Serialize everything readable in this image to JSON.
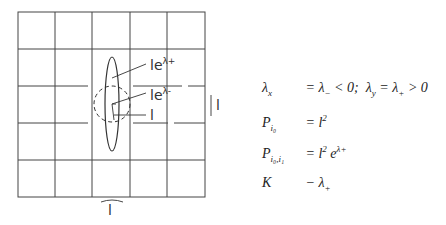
{
  "diagram": {
    "grid": {
      "rows": 5,
      "cols": 5
    },
    "labels": {
      "major_axis": "le",
      "major_exp": "λ+",
      "minor_axis": "le",
      "minor_exp": "λ-",
      "radius": "l",
      "cell_height": "l",
      "cell_width": "l"
    }
  },
  "equations": [
    {
      "lhs": "λx",
      "rhs": "= λ− < 0;  λy = λ+ > 0"
    },
    {
      "lhs": "Pi0",
      "rhs": "= l²"
    },
    {
      "lhs": "Pi0,i1",
      "rhs": "= l² e^λ+"
    },
    {
      "lhs": "K",
      "rhs": "− λ+"
    }
  ]
}
